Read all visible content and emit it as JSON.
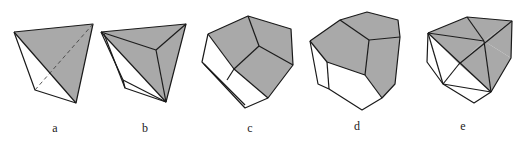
{
  "figure": {
    "panels": [
      {
        "id": "a",
        "label": "a",
        "description": "tetrahedron with one hidden dashed edge"
      },
      {
        "id": "b",
        "label": "b",
        "description": "polyhedron with triangular shaded faces"
      },
      {
        "id": "c",
        "label": "c",
        "description": "polyhedron with three shaded quadrilateral/pentagonal faces"
      },
      {
        "id": "d",
        "label": "d",
        "description": "polyhedron with three shaded pentagonal faces"
      },
      {
        "id": "e",
        "label": "e",
        "description": "polyhedron with triangulated shaded top faces"
      }
    ],
    "colors": {
      "shaded_face": "#a9a9a9",
      "edge": "#1a1a1a",
      "background": "#ffffff"
    }
  }
}
